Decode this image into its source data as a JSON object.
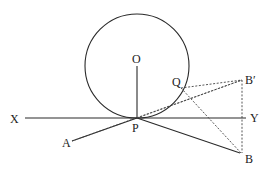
{
  "diagram": {
    "type": "geometry",
    "labels": {
      "O": "O",
      "P": "P",
      "Q": "Q",
      "X": "X",
      "Y": "Y",
      "A": "A",
      "B": "B",
      "Bprime": "B′"
    },
    "colors": {
      "line": "#2a2a2a",
      "background": "#ffffff"
    },
    "elements": [
      {
        "kind": "circle",
        "center": "O",
        "tangent_at": "P"
      },
      {
        "kind": "line",
        "from": "X",
        "to": "Y",
        "style": "solid"
      },
      {
        "kind": "segment",
        "from": "O",
        "to": "P",
        "style": "solid"
      },
      {
        "kind": "segment",
        "from": "A",
        "to": "P",
        "style": "solid"
      },
      {
        "kind": "segment",
        "from": "P",
        "to": "B",
        "style": "solid"
      },
      {
        "kind": "segment",
        "from": "A",
        "to": "Q",
        "style": "dotted"
      },
      {
        "kind": "segment",
        "from": "P",
        "to": "B′",
        "style": "dotted"
      },
      {
        "kind": "segment",
        "from": "Q",
        "to": "B′",
        "style": "dotted"
      },
      {
        "kind": "segment",
        "from": "Q",
        "to": "B",
        "style": "dotted"
      },
      {
        "kind": "segment",
        "from": "B′",
        "to": "B",
        "style": "dotted"
      }
    ]
  }
}
